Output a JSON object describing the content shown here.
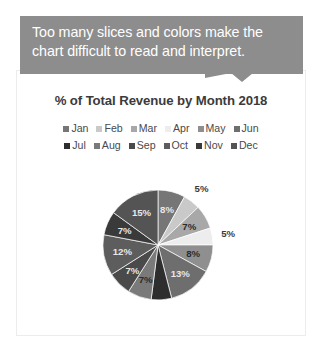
{
  "callout": {
    "line1": "Too many slices and colors make the",
    "line2": "chart difficult to read and interpret.",
    "background": "#8d8d8d",
    "text_color": "#ffffff"
  },
  "chart_title": "% of Total Revenue by Month  2018",
  "legend": {
    "row1": [
      {
        "label": "Jan",
        "color": "#767676"
      },
      {
        "label": "Feb",
        "color": "#c9c9c9"
      },
      {
        "label": "Mar",
        "color": "#a8a8a8"
      },
      {
        "label": "Apr",
        "color": "#ededed"
      },
      {
        "label": "May",
        "color": "#8f8f8f"
      },
      {
        "label": "Jun",
        "color": "#6e6e6e"
      }
    ],
    "row2": [
      {
        "label": "Jul",
        "color": "#2e2e2e"
      },
      {
        "label": "Aug",
        "color": "#7a7a7a"
      },
      {
        "label": "Sep",
        "color": "#4a4a4a"
      },
      {
        "label": "Oct",
        "color": "#5d5d5d"
      },
      {
        "label": "Nov",
        "color": "#3a3a3a"
      },
      {
        "label": "Dec",
        "color": "#545454"
      }
    ]
  },
  "bottom_text": "",
  "chart_data": {
    "type": "pie",
    "title": "% of Total Revenue by Month  2018",
    "legend_position": "top",
    "value_unit": "%",
    "categories": [
      "Jan",
      "Feb",
      "Mar",
      "Apr",
      "May",
      "Jun",
      "Jul",
      "Aug",
      "Sep",
      "Oct",
      "Nov",
      "Dec"
    ],
    "values": [
      8,
      5,
      7,
      5,
      8,
      13,
      6,
      7,
      7,
      12,
      7,
      15
    ],
    "labels": [
      "8%",
      "5%",
      "7%",
      "5%",
      "8%",
      "13%",
      "",
      "7%",
      "7%",
      "12%",
      "7%",
      "15%"
    ],
    "label_placement": [
      "inside",
      "outside",
      "inside",
      "outside",
      "inside",
      "inside",
      "none",
      "inside",
      "inside",
      "inside",
      "inside",
      "inside"
    ],
    "colors": [
      "#767676",
      "#c9c9c9",
      "#a8a8a8",
      "#ededed",
      "#8f8f8f",
      "#6e6e6e",
      "#2e2e2e",
      "#7a7a7a",
      "#4a4a4a",
      "#5d5d5d",
      "#3a3a3a",
      "#545454"
    ],
    "start_angle_deg": 0,
    "direction": "clockwise",
    "note": "Grayscale 12-slice pie; excessive slice count and similar shades make it hard to read."
  }
}
